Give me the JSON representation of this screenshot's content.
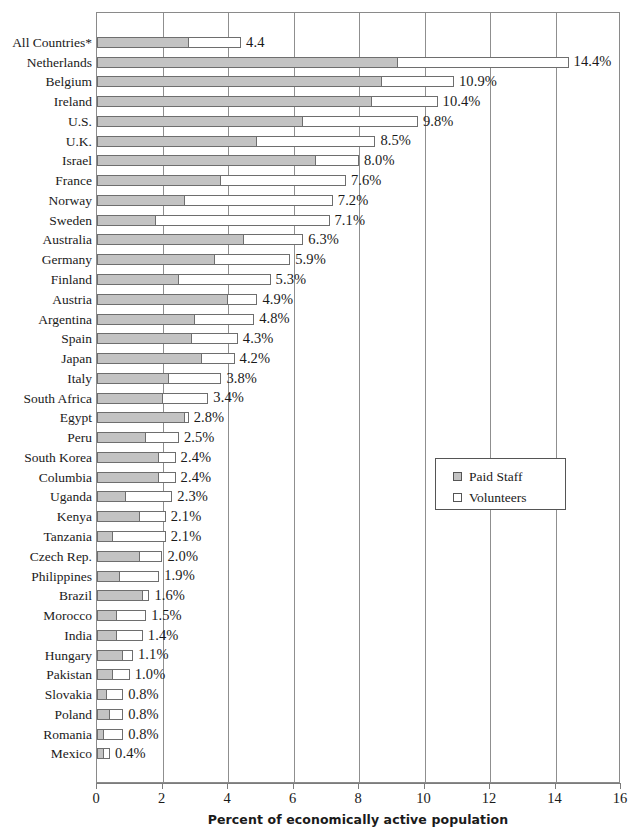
{
  "chart_data": {
    "type": "bar",
    "orientation": "horizontal",
    "stacked": true,
    "title": "",
    "xlabel": "Percent of economically active population",
    "ylabel": "",
    "xlim": [
      0,
      16
    ],
    "xticks": [
      0,
      2,
      4,
      6,
      8,
      10,
      12,
      14,
      16
    ],
    "xtick_labels": [
      "0",
      "2",
      "4",
      "6",
      "8",
      "10",
      "12",
      "14",
      "16"
    ],
    "grid": true,
    "grid_axis": "x",
    "legend_position": "center-right",
    "categories": [
      "All  Countries*",
      "Netherlands",
      "Belgium",
      "Ireland",
      "U.S.",
      "U.K.",
      "Israel",
      "France",
      "Norway",
      "Sweden",
      "Australia",
      "Germany",
      "Finland",
      "Austria",
      "Argentina",
      "Spain",
      "Japan",
      "Italy",
      "South Africa",
      "Egypt",
      "Peru",
      "South Korea",
      "Columbia",
      "Uganda",
      "Kenya",
      "Tanzania",
      "Czech  Rep.",
      "Philippines",
      "Brazil",
      "Morocco",
      "India",
      "Hungary",
      "Pakistan",
      "Slovakia",
      "Poland",
      "Romania",
      "Mexico"
    ],
    "series": [
      {
        "name": "Paid  Staff",
        "color": "#c3c3c3",
        "values": [
          2.8,
          9.2,
          8.7,
          8.4,
          6.3,
          4.9,
          6.7,
          3.8,
          2.7,
          1.8,
          4.5,
          3.6,
          2.5,
          4.0,
          3.0,
          2.9,
          3.2,
          2.2,
          2.0,
          2.7,
          1.5,
          1.9,
          1.9,
          0.9,
          1.3,
          0.5,
          1.3,
          0.7,
          1.4,
          0.6,
          0.6,
          0.8,
          0.5,
          0.3,
          0.4,
          0.2,
          0.2
        ]
      },
      {
        "name": "Volunteers",
        "color": "#ffffff",
        "values": [
          1.6,
          5.2,
          2.2,
          2.0,
          3.5,
          3.6,
          1.3,
          3.8,
          4.5,
          5.3,
          1.8,
          2.3,
          2.8,
          0.9,
          1.8,
          1.4,
          1.0,
          1.6,
          1.4,
          0.1,
          1.0,
          0.5,
          0.5,
          1.4,
          0.8,
          1.6,
          0.7,
          1.2,
          0.2,
          0.9,
          0.8,
          0.3,
          0.5,
          0.5,
          0.4,
          0.6,
          0.2
        ]
      }
    ],
    "totals": [
      4.4,
      14.4,
      10.9,
      10.4,
      9.8,
      8.5,
      8.0,
      7.6,
      7.2,
      7.1,
      6.3,
      5.9,
      5.3,
      4.9,
      4.8,
      4.3,
      4.2,
      3.8,
      3.4,
      2.8,
      2.5,
      2.4,
      2.4,
      2.3,
      2.1,
      2.1,
      2.0,
      1.9,
      1.6,
      1.5,
      1.4,
      1.1,
      1.0,
      0.8,
      0.8,
      0.8,
      0.4
    ],
    "value_labels": [
      "4.4",
      "14.4%",
      "10.9%",
      "10.4%",
      "9.8%",
      "8.5%",
      "8.0%",
      "7.6%",
      "7.2%",
      "7.1%",
      "6.3%",
      "5.9%",
      "5.3%",
      "4.9%",
      "4.8%",
      "4.3%",
      "4.2%",
      "3.8%",
      "3.4%",
      "2.8%",
      "2.5%",
      "2.4%",
      "2.4%",
      "2.3%",
      "2.1%",
      "2.1%",
      "2.0%",
      "1.9%",
      "1.6%",
      "1.5%",
      "1.4%",
      "1.1%",
      "1.0%",
      "0.8%",
      "0.8%",
      "0.8%",
      "0.4%"
    ]
  },
  "legend": {
    "entries": [
      {
        "label": "Paid  Staff",
        "swatch": "paid"
      },
      {
        "label": "Volunteers",
        "swatch": "vol"
      }
    ]
  }
}
